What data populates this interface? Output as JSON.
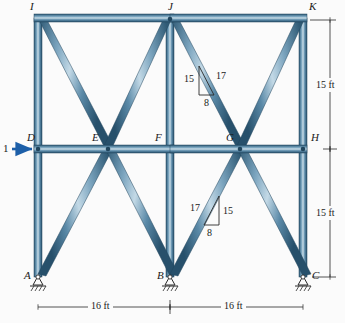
{
  "figure": {
    "background_color": "#fbfbfb",
    "member_color": "#4a7fa0",
    "member_edge_color": "#2f5a75",
    "member_highlight_color": "#cfe0ea",
    "label_color": "#1a1a1a",
    "arrow_color": "#1d5fa8"
  },
  "joints": [
    {
      "id": "A",
      "label": "A",
      "x": 38,
      "y": 277,
      "support": "pin"
    },
    {
      "id": "B",
      "label": "B",
      "x": 170,
      "y": 277,
      "support": "pin"
    },
    {
      "id": "C",
      "label": "C",
      "x": 303,
      "y": 277,
      "support": "pin"
    },
    {
      "id": "D",
      "label": "D",
      "x": 38,
      "y": 149,
      "support": "none"
    },
    {
      "id": "E",
      "label": "E",
      "x": 108,
      "y": 149,
      "support": "none"
    },
    {
      "id": "F",
      "label": "F",
      "x": 170,
      "y": 149,
      "support": "none"
    },
    {
      "id": "G",
      "label": "G",
      "x": 240,
      "y": 149,
      "support": "none"
    },
    {
      "id": "H",
      "label": "H",
      "x": 303,
      "y": 149,
      "support": "none"
    },
    {
      "id": "I",
      "label": "I",
      "x": 38,
      "y": 18,
      "support": "none"
    },
    {
      "id": "J",
      "label": "J",
      "x": 170,
      "y": 18,
      "support": "none"
    },
    {
      "id": "K",
      "label": "K",
      "x": 303,
      "y": 18,
      "support": "none"
    }
  ],
  "load": {
    "label": "1",
    "applied_at": "D",
    "direction": "right",
    "arrow_color": "#1d5fa8"
  },
  "slope_triangles": [
    {
      "id": "upper",
      "rise_label": "15",
      "run_label": "8",
      "hyp_label": "17",
      "rise_side": "left",
      "hyp_side": "right",
      "member": "J-G"
    },
    {
      "id": "lower",
      "rise_label": "15",
      "run_label": "8",
      "hyp_label": "17",
      "rise_side": "right",
      "hyp_side": "left",
      "member": "G-B"
    }
  ],
  "dimensions": {
    "horizontal": [
      {
        "label": "16 ft",
        "from": "A",
        "to": "B"
      },
      {
        "label": "16 ft",
        "from": "B",
        "to": "C"
      }
    ],
    "vertical": [
      {
        "label": "15 ft",
        "from": "K",
        "to": "H"
      },
      {
        "label": "15 ft",
        "from": "H",
        "to": "C"
      }
    ]
  }
}
